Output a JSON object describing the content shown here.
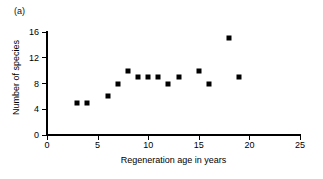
{
  "panel": {
    "label": "(a)"
  },
  "chart_data": {
    "type": "scatter",
    "title": "",
    "subtitle": "",
    "xlabel": "Regeneration age in years",
    "ylabel": "Number of species",
    "xlim": [
      0,
      25
    ],
    "ylim": [
      0,
      16
    ],
    "xticks": [
      0,
      5,
      10,
      15,
      20,
      25
    ],
    "yticks": [
      0,
      4,
      8,
      12,
      16
    ],
    "grid": false,
    "legend": null,
    "marker": {
      "shape": "square",
      "color": "#000000",
      "size_px": 5
    },
    "series": [
      {
        "name": "Species richness",
        "x": [
          3,
          4,
          6,
          7,
          8,
          9,
          10,
          11,
          12,
          13,
          15,
          16,
          18,
          19
        ],
        "y": [
          5,
          5,
          6,
          8,
          10,
          9,
          9,
          9,
          8,
          9,
          10,
          8,
          15,
          9
        ],
        "points": [
          {
            "x": 3,
            "y": 5
          },
          {
            "x": 4,
            "y": 5
          },
          {
            "x": 6,
            "y": 6
          },
          {
            "x": 7,
            "y": 8
          },
          {
            "x": 8,
            "y": 10
          },
          {
            "x": 9,
            "y": 9
          },
          {
            "x": 10,
            "y": 9
          },
          {
            "x": 11,
            "y": 9
          },
          {
            "x": 12,
            "y": 8
          },
          {
            "x": 13,
            "y": 9
          },
          {
            "x": 15,
            "y": 10
          },
          {
            "x": 16,
            "y": 8
          },
          {
            "x": 18,
            "y": 15
          },
          {
            "x": 19,
            "y": 9
          }
        ]
      }
    ],
    "annotations": [
      {
        "text": "(a)",
        "position": "top-left"
      }
    ]
  },
  "axes": {
    "x_tick_labels": [
      "0",
      "5",
      "10",
      "15",
      "20",
      "25"
    ],
    "y_tick_labels": [
      "0",
      "4",
      "8",
      "12",
      "16"
    ],
    "x_title": "Regeneration age in years",
    "y_title": "Number of species"
  },
  "colors": {
    "background": "#ffffff",
    "axis": "#000000",
    "marker": "#000000",
    "text": "#000000"
  }
}
